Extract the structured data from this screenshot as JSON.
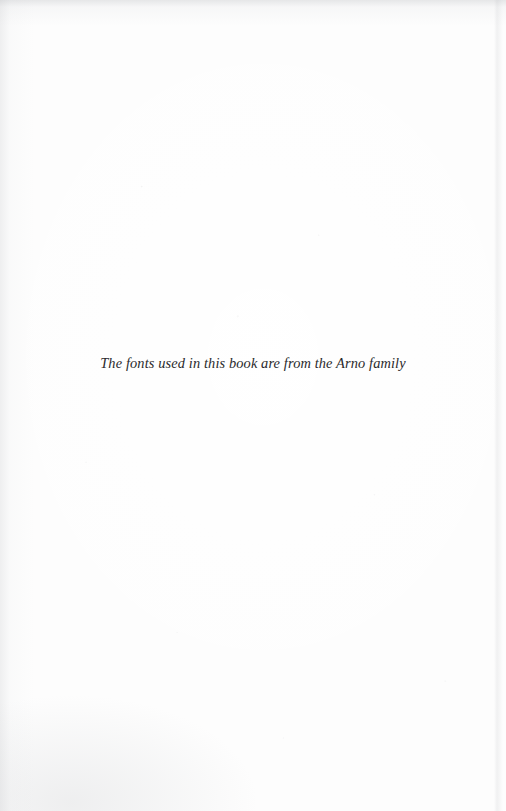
{
  "page": {
    "kind": "book-colophon-page",
    "background_color": "#fdfdfd",
    "text_color": "#2a2a2c"
  },
  "colophon": {
    "note": "The fonts used in this book are from the Arno family"
  }
}
